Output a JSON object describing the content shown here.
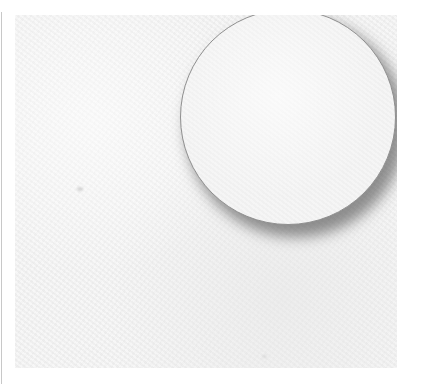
{
  "scene": {
    "description": "Blank textured paper with a white circle and drop shadow",
    "colors": {
      "background": "#ffffff",
      "paper": "#f1f1f1",
      "circle_fill": "#f3f3f3",
      "circle_outline": "#8f8f8f",
      "shadow": "#3c3c3c",
      "left_rule": "#c8c8c8"
    },
    "shapes": [
      {
        "type": "rectangle",
        "name": "paper",
        "x": 15,
        "y": 15,
        "width": 382,
        "height": 353
      },
      {
        "type": "circle",
        "name": "circle",
        "cx": 289,
        "cy": 120,
        "r": 109,
        "shadow_offset": [
          8,
          10
        ],
        "shadow_blur": 14
      }
    ]
  }
}
